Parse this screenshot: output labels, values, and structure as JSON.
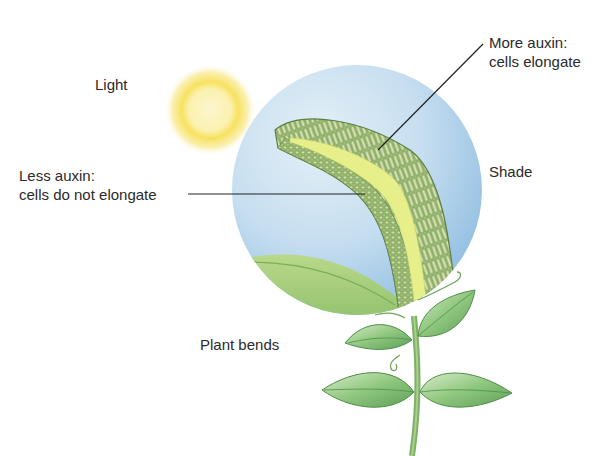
{
  "labels": {
    "light": "Light",
    "shade": "Shade",
    "plant_bends": "Plant bends",
    "less_auxin_line1": "Less auxin:",
    "less_auxin_line2": "cells do not elongate",
    "more_auxin_line1": "More auxin:",
    "more_auxin_line2": "cells elongate"
  },
  "colors": {
    "background": "#ffffff",
    "sun_outer": "#f7e15a",
    "sun_inner": "#fbf3b8",
    "sky_circle": "#bcd8ec",
    "sky_circle_edge": "#9cc4e4",
    "stem_tissue": "#9bbf6e",
    "stem_core": "#e6ef8a",
    "leaf": "#8fc77f",
    "leaf_dark": "#5e9e57",
    "text": "#2a2a2a",
    "leader_line": "#222222"
  }
}
